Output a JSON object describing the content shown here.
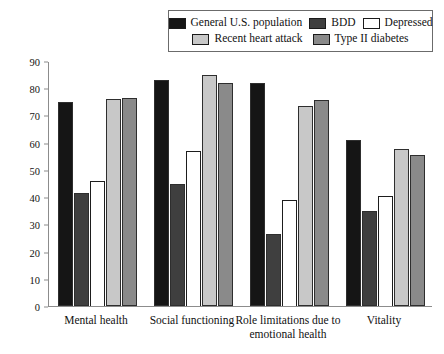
{
  "chart_data": {
    "type": "bar",
    "title": "",
    "xlabel": "",
    "ylabel": "",
    "ylim": [
      0,
      90
    ],
    "yticks": [
      0,
      10,
      20,
      30,
      40,
      50,
      60,
      70,
      80,
      90
    ],
    "grid": false,
    "legend_position": "top-right",
    "categories": [
      "Mental health",
      "Social functioning",
      "Role limitations due to emotional health",
      "Vitality"
    ],
    "category_lines": [
      [
        "Mental health"
      ],
      [
        "Social functioning"
      ],
      [
        "Role limitations due to",
        "emotional health"
      ],
      [
        "Vitality"
      ]
    ],
    "series": [
      {
        "name": "General U.S. population",
        "color": "#151515",
        "values": [
          75,
          83,
          82,
          61
        ]
      },
      {
        "name": "BDD",
        "color": "#3f3f3f",
        "values": [
          41.5,
          45,
          26.5,
          35
        ]
      },
      {
        "name": "Depressed",
        "color": "#ffffff",
        "values": [
          46,
          57,
          39,
          40.5
        ]
      },
      {
        "name": "Recent heart attack",
        "color": "#c8c8c8",
        "values": [
          76,
          85,
          73.5,
          57.5
        ]
      },
      {
        "name": "Type II diabetes",
        "color": "#8a8a8a",
        "values": [
          76.5,
          82,
          75.5,
          55.5
        ]
      }
    ]
  },
  "legend": {
    "row1": [
      {
        "label": "General U.S. population",
        "color": "#151515"
      },
      {
        "label": "BDD",
        "color": "#3f3f3f"
      },
      {
        "label": "Depressed",
        "color": "#ffffff"
      }
    ],
    "row2": [
      {
        "label": "Recent heart attack",
        "color": "#c8c8c8"
      },
      {
        "label": "Type II diabetes",
        "color": "#8a8a8a"
      }
    ]
  }
}
